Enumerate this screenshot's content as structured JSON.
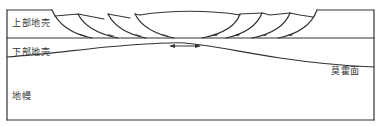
{
  "diagram": {
    "title": "",
    "labels": {
      "upper_crust": "上部地壳",
      "lower_crust": "下部地壳",
      "mantle": "地幔",
      "moho": "莫霍面"
    },
    "annotations": {
      "extension_arrow": "double-headed horizontal arrow indicating extension",
      "fault_type": "listric normal faults",
      "left_fault_count": 4,
      "right_fault_count": 4
    },
    "colors": {
      "line": "#333333",
      "background": "#ffffff"
    }
  }
}
